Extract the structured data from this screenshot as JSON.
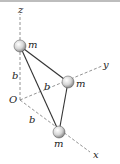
{
  "diagram": {
    "title": "",
    "axes": {
      "x": "x",
      "y": "y",
      "z": "z",
      "origin": "O"
    },
    "dimensions": {
      "z_offset": "b",
      "y_offset": "b",
      "x_offset": "b"
    },
    "masses": [
      {
        "label": "m",
        "on_axis": "z"
      },
      {
        "label": "m",
        "on_axis": "y"
      },
      {
        "label": "m",
        "on_axis": "x"
      }
    ],
    "colors": {
      "rod": "#333333",
      "axis": "#777777",
      "sphere_highlight": "#ffffff",
      "sphere_shadow": "#8a8a8a"
    }
  }
}
